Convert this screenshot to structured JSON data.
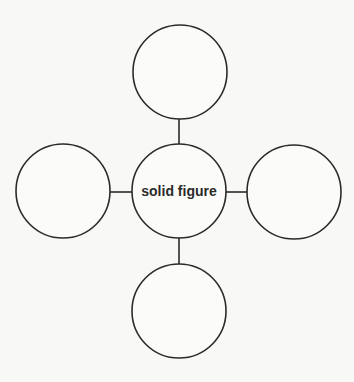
{
  "diagram": {
    "type": "concept-web",
    "center": {
      "label": "solid figure"
    },
    "branches": [
      {
        "position": "top",
        "label": ""
      },
      {
        "position": "left",
        "label": ""
      },
      {
        "position": "right",
        "label": ""
      },
      {
        "position": "bottom",
        "label": ""
      }
    ]
  },
  "colors": {
    "stroke": "#2b2b2b",
    "background": "#f8f8f6",
    "text": "#2a2a2a"
  }
}
